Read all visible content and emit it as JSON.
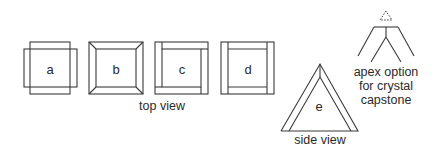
{
  "diagram": {
    "top_view": {
      "caption": "top view",
      "items": [
        {
          "label": "a",
          "style": "overlapping-rectangles"
        },
        {
          "label": "b",
          "style": "mitered-frame"
        },
        {
          "label": "c",
          "style": "pinwheel-frame"
        },
        {
          "label": "d",
          "style": "butt-joint-frame"
        }
      ]
    },
    "side_view": {
      "caption": "side view",
      "label": "e",
      "shape": "double-outline-triangle"
    },
    "apex": {
      "caption_lines": [
        "apex option",
        "for crystal",
        "capstone"
      ],
      "shape": "dashed-triangle-over-fork"
    },
    "colors": {
      "line": "#3a3a3a",
      "text": "#2a2a2a",
      "background": "#ffffff"
    }
  }
}
